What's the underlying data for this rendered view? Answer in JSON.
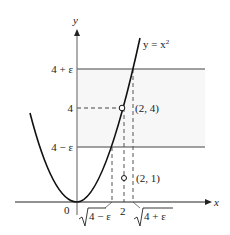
{
  "figure": {
    "curve_label": "y = x",
    "curve_label_exp": "2",
    "axes": {
      "x_label": "x",
      "y_label": "y",
      "origin_label": "0"
    },
    "y_ticks": [
      {
        "label": "4 + ε",
        "value": "4+epsilon"
      },
      {
        "label": "4",
        "value": 4
      },
      {
        "label": "4 − ε",
        "value": "4-epsilon"
      }
    ],
    "x_ticks": [
      {
        "label": "4 − ε",
        "radical": true,
        "value": "sqrt(4-epsilon)"
      },
      {
        "label": "2",
        "radical": false,
        "value": 2
      },
      {
        "label": "4 + ε",
        "radical": true,
        "value": "sqrt(4+epsilon)"
      }
    ],
    "points": [
      {
        "label": "(2, 4)",
        "x": 2,
        "y": 4,
        "style": "open-circle"
      },
      {
        "label": "(2, 1)",
        "x": 2,
        "y": 1,
        "style": "open-circle"
      }
    ],
    "colors": {
      "ink": "#1a1a1a",
      "band": "#f7f7f7"
    }
  }
}
